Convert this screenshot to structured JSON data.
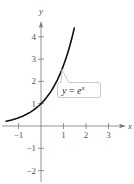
{
  "chart_data": {
    "type": "line",
    "title": "",
    "xlabel": "x",
    "ylabel": "y",
    "xlim": [
      -1.6,
      3.7
    ],
    "ylim": [
      -2.5,
      4.6
    ],
    "grid": false,
    "x_ticks": [
      -1,
      1,
      2,
      3
    ],
    "x_tick_labels": [
      "−1",
      "1",
      "2",
      "3"
    ],
    "y_ticks": [
      4,
      3,
      2,
      1,
      -1,
      -2
    ],
    "y_tick_labels": [
      "4",
      "3",
      "2",
      "1",
      "−1",
      "−2"
    ],
    "series": [
      {
        "name": "y = e^x",
        "function": "e^x",
        "x": [
          -1.55,
          -1.0,
          -0.5,
          0.0,
          0.5,
          1.0,
          1.25,
          1.48
        ],
        "y": [
          0.21,
          0.37,
          0.61,
          1.0,
          1.65,
          2.72,
          3.49,
          4.39
        ],
        "color": "#111111"
      }
    ],
    "annotations": [
      {
        "text_y": "y",
        "text_eq": " = ",
        "text_e": "e",
        "text_exp": "x",
        "points_to": [
          0.95,
          2.6
        ]
      }
    ]
  },
  "colors": {
    "axis": "#777777",
    "curve": "#111111",
    "callout_border": "#bbbbbb"
  }
}
